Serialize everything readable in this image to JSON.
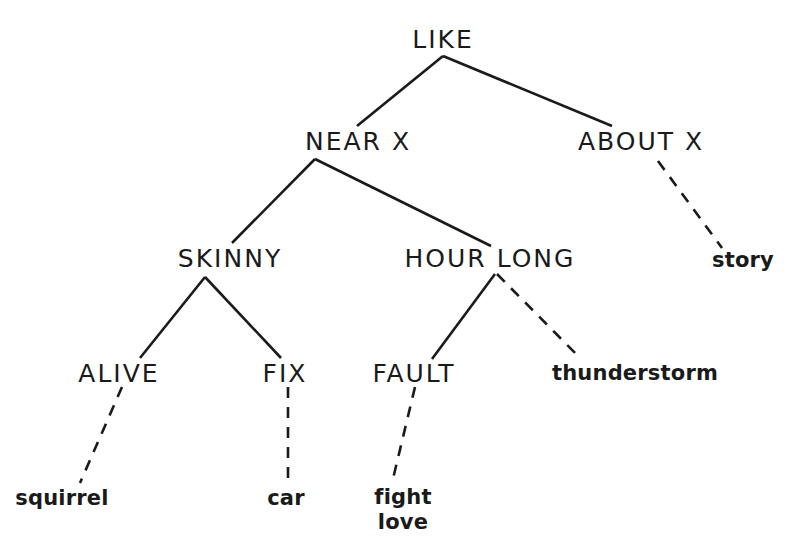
{
  "diagram": {
    "type": "tree",
    "background_color": "#ffffff",
    "line_color": "#1a1a1a",
    "text_color": "#1a1a1a",
    "nodes": [
      {
        "id": "like",
        "label": "LIKE",
        "kind": "category",
        "x": 443,
        "y": 40
      },
      {
        "id": "near_x",
        "label": "NEAR X",
        "kind": "category",
        "x": 358,
        "y": 142
      },
      {
        "id": "about_x",
        "label": "ABOUT X",
        "kind": "category",
        "x": 641,
        "y": 142
      },
      {
        "id": "skinny",
        "label": "SKINNY",
        "kind": "category",
        "x": 230,
        "y": 259
      },
      {
        "id": "hour_long",
        "label": "HOUR LONG",
        "kind": "category",
        "x": 490,
        "y": 259
      },
      {
        "id": "alive",
        "label": "ALIVE",
        "kind": "category",
        "x": 119,
        "y": 374
      },
      {
        "id": "fix",
        "label": "FIX",
        "kind": "category",
        "x": 285,
        "y": 374
      },
      {
        "id": "fault",
        "label": "FAULT",
        "kind": "category",
        "x": 414,
        "y": 374
      },
      {
        "id": "story",
        "label": "story",
        "kind": "lexical",
        "x": 743,
        "y": 260
      },
      {
        "id": "thunderstorm",
        "label": "thunderstorm",
        "kind": "lexical",
        "x": 635,
        "y": 373
      },
      {
        "id": "squirrel",
        "label": "squirrel",
        "kind": "lexical",
        "x": 62,
        "y": 498
      },
      {
        "id": "car",
        "label": "car",
        "kind": "lexical",
        "x": 286,
        "y": 498
      },
      {
        "id": "fight_love",
        "label": "fight\nlove",
        "kind": "lexical",
        "x": 403,
        "y": 510,
        "lines": [
          "fight",
          "love"
        ]
      }
    ],
    "edges": [
      {
        "from": "like",
        "to": "near_x",
        "style": "solid",
        "x1": 443,
        "y1": 56,
        "x2": 357,
        "y2": 126
      },
      {
        "from": "like",
        "to": "about_x",
        "style": "solid",
        "x1": 443,
        "y1": 56,
        "x2": 612,
        "y2": 126
      },
      {
        "from": "near_x",
        "to": "skinny",
        "style": "solid",
        "x1": 315,
        "y1": 159,
        "x2": 232,
        "y2": 243
      },
      {
        "from": "near_x",
        "to": "hour_long",
        "style": "solid",
        "x1": 315,
        "y1": 159,
        "x2": 491,
        "y2": 246
      },
      {
        "from": "about_x",
        "to": "story",
        "style": "dashed",
        "x1": 658,
        "y1": 161,
        "x2": 722,
        "y2": 248
      },
      {
        "from": "skinny",
        "to": "alive",
        "style": "solid",
        "x1": 205,
        "y1": 277,
        "x2": 140,
        "y2": 358
      },
      {
        "from": "skinny",
        "to": "fix",
        "style": "solid",
        "x1": 205,
        "y1": 277,
        "x2": 281,
        "y2": 358
      },
      {
        "from": "hour_long",
        "to": "fault",
        "style": "solid",
        "x1": 495,
        "y1": 274,
        "x2": 432,
        "y2": 359
      },
      {
        "from": "hour_long",
        "to": "thunderstorm",
        "style": "dashed",
        "x1": 497,
        "y1": 274,
        "x2": 581,
        "y2": 359
      },
      {
        "from": "alive",
        "to": "squirrel",
        "style": "dashed",
        "x1": 122,
        "y1": 387,
        "x2": 80,
        "y2": 483
      },
      {
        "from": "fix",
        "to": "car",
        "style": "dashed",
        "x1": 288,
        "y1": 387,
        "x2": 288,
        "y2": 483
      },
      {
        "from": "fault",
        "to": "fight_love",
        "style": "dashed",
        "x1": 415,
        "y1": 387,
        "x2": 392,
        "y2": 483
      }
    ]
  }
}
